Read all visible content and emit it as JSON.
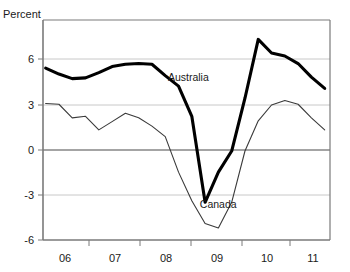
{
  "axis_title": "Percent",
  "labels": {
    "australia": "Australia",
    "canada": "Canada"
  },
  "colors": {
    "line_australia": "#000000",
    "line_canada": "#3a3a3a",
    "gridline": "#c8c8c8",
    "zero_line": "#4a4a4a",
    "frame": "#7a7a7a",
    "text": "#1a1a1a",
    "background": "#ffffff"
  },
  "chart_data": {
    "type": "line",
    "title": "",
    "subtitle": "",
    "xlabel": "",
    "ylabel": "Percent",
    "ylim": [
      -6,
      8
    ],
    "xlim": [
      2005.6,
      2011.0
    ],
    "grid": true,
    "legend": "inline-annotations",
    "ytick_labels": [
      "6",
      "3",
      "0",
      "-3",
      "-6"
    ],
    "ytick_values": [
      6,
      3,
      0,
      -3,
      -6
    ],
    "xtick_labels": [
      "06",
      "07",
      "08",
      "09",
      "10",
      "11"
    ],
    "xtick_values": [
      2006,
      2007,
      2008,
      2009,
      2010,
      2011
    ],
    "annotations": [
      {
        "text": "Australia",
        "x": 2007.95,
        "y": 4.55
      },
      {
        "text": "Canada",
        "x": 2008.55,
        "y": -3.9
      }
    ],
    "series": [
      {
        "name": "Australia",
        "style": "thick",
        "x": [
          2005.65,
          2005.9,
          2006.15,
          2006.4,
          2006.65,
          2006.9,
          2007.15,
          2007.4,
          2007.65,
          2007.9,
          2008.15,
          2008.4,
          2008.65,
          2008.9,
          2009.15,
          2009.4,
          2009.65,
          2009.9,
          2010.15,
          2010.4,
          2010.65,
          2010.9
        ],
        "values": [
          5.4,
          5.0,
          4.7,
          4.75,
          5.1,
          5.5,
          5.65,
          5.7,
          5.65,
          4.9,
          4.2,
          2.2,
          -3.5,
          -1.5,
          -0.1,
          3.4,
          7.3,
          6.4,
          6.2,
          5.7,
          4.8,
          4.05
        ]
      },
      {
        "name": "Canada",
        "style": "thin",
        "x": [
          2005.65,
          2005.9,
          2006.15,
          2006.4,
          2006.65,
          2006.9,
          2007.15,
          2007.4,
          2007.65,
          2007.9,
          2008.15,
          2008.4,
          2008.65,
          2008.9,
          2009.15,
          2009.4,
          2009.65,
          2009.9,
          2010.15,
          2010.4,
          2010.65,
          2010.9
        ],
        "values": [
          3.05,
          3.0,
          2.1,
          2.2,
          1.3,
          1.85,
          2.4,
          2.1,
          1.55,
          0.85,
          -1.5,
          -3.4,
          -4.9,
          -5.2,
          -3.5,
          -0.1,
          1.9,
          2.95,
          3.25,
          3.0,
          2.1,
          1.3
        ]
      }
    ]
  }
}
